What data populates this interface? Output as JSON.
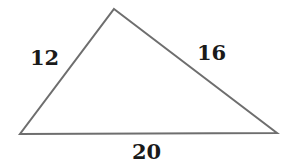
{
  "figure": {
    "name": "triangle-with-side-lengths",
    "background_color": "#ffffff",
    "stroke_color": "#6e6e6e",
    "stroke_width": 2,
    "text_color": "#1a1a1a",
    "vertices": {
      "apex": {
        "x": 114,
        "y": 9
      },
      "left": {
        "x": 20,
        "y": 134
      },
      "right": {
        "x": 277,
        "y": 133
      }
    },
    "sides": [
      {
        "id": "left-side",
        "label": "12",
        "from": "left",
        "to": "apex"
      },
      {
        "id": "right-side",
        "label": "16",
        "from": "apex",
        "to": "right"
      },
      {
        "id": "base-side",
        "label": "20",
        "from": "left",
        "to": "right"
      }
    ],
    "labels": {
      "left_side": "12",
      "right_side": "16",
      "base_side": "20"
    }
  },
  "chart_data": {
    "type": "diagram",
    "shape": "triangle",
    "title": "",
    "categories": [
      "left side",
      "right side",
      "base"
    ],
    "values": [
      12,
      16,
      20
    ],
    "units": "",
    "annotations": [
      "12",
      "16",
      "20"
    ],
    "grid": false,
    "legend": "none"
  }
}
